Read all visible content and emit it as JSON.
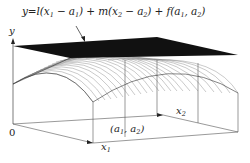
{
  "figure": {
    "type": "3d-surface-with-tangent-plane",
    "formula": {
      "y_eq": "y=",
      "l": "l",
      "term1_open": "(x",
      "term1_sub_x": "1",
      "term1_minus": " − a",
      "term1_sub_a": "1",
      "term1_close": ") + ",
      "m": "m",
      "term2_open": "(x",
      "term2_sub_x": "2",
      "term2_minus": " − a",
      "term2_sub_a": "2",
      "term2_close": ") + ",
      "f": "f",
      "f_open": "(a",
      "f_sub1": "1",
      "f_comma": ", a",
      "f_sub2": "2",
      "f_close": ")"
    },
    "axes": {
      "y_label": "y",
      "origin_label": "0",
      "x1_label": "x",
      "x1_sub": "1",
      "x2_label": "x",
      "x2_sub": "2"
    },
    "point_label": {
      "open": "(a",
      "sub1": "1",
      "comma": ", a",
      "sub2": "2",
      "close": ")"
    },
    "colors": {
      "plane": "#111111",
      "mesh": "#555555",
      "axis": "#444444"
    }
  }
}
